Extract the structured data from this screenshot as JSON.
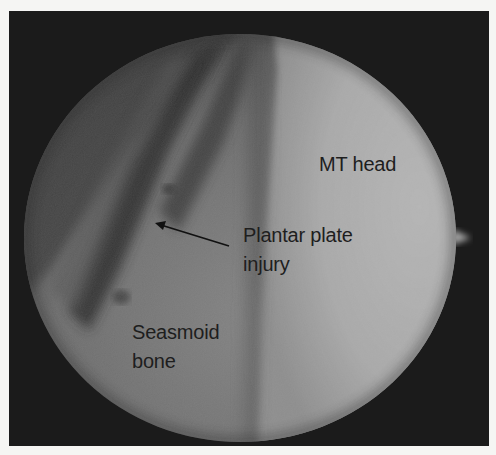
{
  "figure": {
    "type": "arthroscopic image",
    "labels": {
      "mt_head": "MT head",
      "plantar_plate_line1": "Plantar plate",
      "plantar_plate_line2": "injury",
      "sesamoid_line1": "Seasmoid",
      "sesamoid_line2": "bone"
    },
    "arrow": {
      "from": [
        220,
        235
      ],
      "to": [
        147,
        213
      ],
      "points_to": "Plantar plate injury"
    },
    "colors": {
      "background": "#f5f5f3",
      "frame": "#1b1b1b",
      "mt_head_region": "#adadad",
      "soft_tissue_region": "#7a7a7a",
      "dark_band": "#3a3a3a",
      "label_text": "#1e1e1e"
    }
  }
}
